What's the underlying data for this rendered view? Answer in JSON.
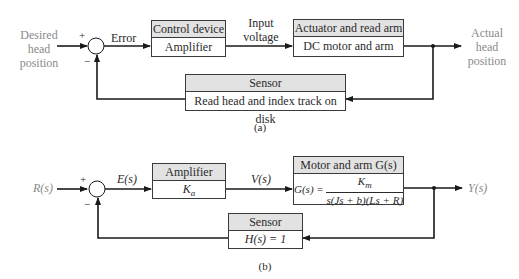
{
  "diagram_a": {
    "caption": "(a)",
    "input_label": [
      "Desired",
      "head",
      "position"
    ],
    "plus_sign": "+",
    "minus_sign": "−",
    "error_label": "Error",
    "control_block": {
      "header": "Control device",
      "body": "Amplifier"
    },
    "signal_label": [
      "Input",
      "voltage"
    ],
    "actuator_block": {
      "header": "Actuator and read arm",
      "body": "DC motor and arm"
    },
    "output_label": [
      "Actual",
      "head",
      "position"
    ],
    "sensor_block": {
      "header": "Sensor",
      "body": "Read head and index track on disk"
    }
  },
  "diagram_b": {
    "caption": "(b)",
    "input_label": "R(s)",
    "plus_sign": "+",
    "minus_sign": "−",
    "error_label": "E(s)",
    "amplifier_block": {
      "header": "Amplifier",
      "gain_symbol": "K",
      "gain_subscript": "a"
    },
    "signal_label": "V(s)",
    "plant_block": {
      "header": "Motor and arm G(s)",
      "lhs": "G(s) =",
      "numerator_symbol": "K",
      "numerator_subscript": "m",
      "denominator": "s(Js + b)(Ls + R)"
    },
    "output_label": "Y(s)",
    "sensor_block": {
      "header": "Sensor",
      "body": "H(s) = 1"
    }
  },
  "colors": {
    "line": "#1a1a1a",
    "header_fill": "#e2e2e2",
    "label_gray": "#8a8a8a"
  }
}
